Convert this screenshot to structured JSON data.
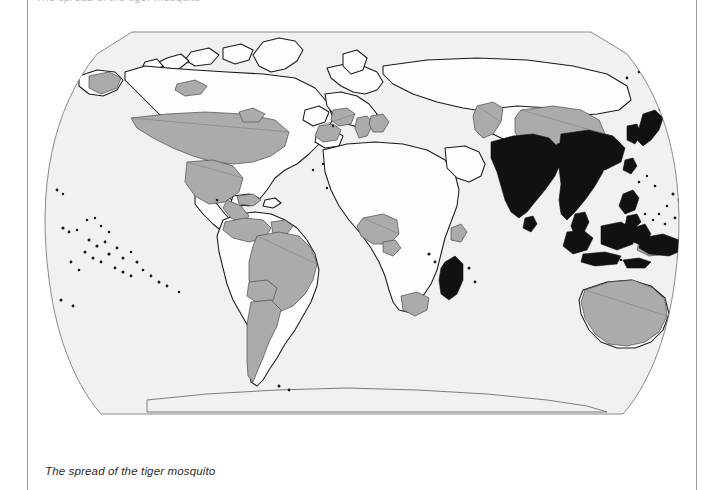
{
  "page": {
    "width": 718,
    "height": 490,
    "background": "#ffffff",
    "top_clipped_text": "The spread of the tiger mosquito"
  },
  "rules": {
    "left_x": 27,
    "right_x": 696,
    "color": "#9a9a9a"
  },
  "caption": {
    "text": "The spread of the tiger mosquito",
    "style": "italic",
    "color": "#2b2b2b"
  },
  "map": {
    "title": "The spread of the tiger mosquito",
    "projection": "robinson",
    "graticule": false,
    "ocean_color": "#f1f1f1",
    "land_color": "#fdfdfd",
    "border_color": "#7d7d7d",
    "coast_color": "#1a1a1a",
    "frame_color": "#8a8a8a",
    "legend_visible": false,
    "categories": [
      {
        "key": "native",
        "label": "Native range",
        "color": "#111111",
        "regions": [
          "India",
          "Sri Lanka",
          "Bangladesh",
          "Nepal",
          "Bhutan",
          "Myanmar",
          "Thailand",
          "Laos",
          "Cambodia",
          "Vietnam",
          "Malaysia",
          "Singapore",
          "Indonesia",
          "Brunei",
          "Philippines",
          "Papua New Guinea",
          "Southern China",
          "Taiwan",
          "Japan",
          "North Korea",
          "South Korea",
          "Madagascar"
        ]
      },
      {
        "key": "spread",
        "label": "Introduced / spread range",
        "color": "#ababab",
        "regions": [
          "United States",
          "Mexico",
          "Guatemala",
          "Belize",
          "Honduras",
          "El Salvador",
          "Nicaragua",
          "Costa Rica",
          "Panama",
          "Cuba",
          "Dominican Republic",
          "Jamaica",
          "Trinidad and Tobago",
          "Colombia",
          "Venezuela",
          "Guyana",
          "Suriname",
          "French Guiana",
          "Brazil",
          "Bolivia",
          "Paraguay",
          "Uruguay",
          "Argentina",
          "Spain",
          "France",
          "Italy",
          "Switzerland",
          "Albania",
          "Greece",
          "Croatia",
          "Slovenia",
          "Bosnia and Herzegovina",
          "Serbia",
          "Montenegro",
          "Nigeria",
          "Cameroon",
          "Central African Republic",
          "Gabon",
          "Equatorial Guinea",
          "South Africa",
          "Somalia",
          "Kazakhstan",
          "Uzbekistan",
          "Turkmenistan",
          "China",
          "Australia",
          "New Zealand",
          "Canada (partial)"
        ]
      },
      {
        "key": "absent",
        "label": "Not present",
        "color": "#fdfdfd",
        "regions": []
      }
    ],
    "geometry_note": "Oceania island chains rendered as discrete point marks."
  }
}
